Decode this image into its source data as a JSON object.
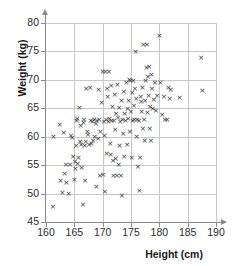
{
  "chart_data": {
    "type": "scatter",
    "title": "",
    "xlabel": "Height (cm)",
    "ylabel": "Weight (kg)",
    "xlim": [
      160,
      190
    ],
    "ylim": [
      45,
      80
    ],
    "xticks": [
      160,
      165,
      170,
      175,
      180,
      185,
      190
    ],
    "yticks": [
      45,
      50,
      55,
      60,
      65,
      70,
      75,
      80
    ],
    "grid": true,
    "legend": null,
    "marker": "x",
    "marker_color": "#333333",
    "grid_color": "#c8c8c8",
    "axis_color": "#8a8a8a",
    "points": [
      [
        161.2,
        47.7
      ],
      [
        161.3,
        60.1
      ],
      [
        162.4,
        62.2
      ],
      [
        162.6,
        52.3
      ],
      [
        162.9,
        50.2
      ],
      [
        163.1,
        60.7
      ],
      [
        163.3,
        53.6
      ],
      [
        163.5,
        55.1
      ],
      [
        163.6,
        52.0
      ],
      [
        164.0,
        50.0
      ],
      [
        164.2,
        55.2
      ],
      [
        164.4,
        60.3
      ],
      [
        164.6,
        59.9
      ],
      [
        164.8,
        56.5
      ],
      [
        165.0,
        52.4
      ],
      [
        165.1,
        55.6
      ],
      [
        165.2,
        54.4
      ],
      [
        165.3,
        58.5
      ],
      [
        165.4,
        62.8
      ],
      [
        165.5,
        63.2
      ],
      [
        165.6,
        55.3
      ],
      [
        165.7,
        56.4
      ],
      [
        165.9,
        65.1
      ],
      [
        166.0,
        59.1
      ],
      [
        166.1,
        61.9
      ],
      [
        166.2,
        58.7
      ],
      [
        166.3,
        54.6
      ],
      [
        166.5,
        48.0
      ],
      [
        166.6,
        62.5
      ],
      [
        166.7,
        63.1
      ],
      [
        166.8,
        58.4
      ],
      [
        166.9,
        52.3
      ],
      [
        167.0,
        59.2
      ],
      [
        167.1,
        68.4
      ],
      [
        167.3,
        61.0
      ],
      [
        167.4,
        60.4
      ],
      [
        167.6,
        58.6
      ],
      [
        167.8,
        68.6
      ],
      [
        167.9,
        62.9
      ],
      [
        168.0,
        58.8
      ],
      [
        168.2,
        62.6
      ],
      [
        168.3,
        59.4
      ],
      [
        168.5,
        63.0
      ],
      [
        168.6,
        60.1
      ],
      [
        168.8,
        62.4
      ],
      [
        168.9,
        51.3
      ],
      [
        169.0,
        62.8
      ],
      [
        169.2,
        59.6
      ],
      [
        169.3,
        68.3
      ],
      [
        169.4,
        63.0
      ],
      [
        169.5,
        53.2
      ],
      [
        169.6,
        61.0
      ],
      [
        169.8,
        66.0
      ],
      [
        170.0,
        71.4
      ],
      [
        170.1,
        53.3
      ],
      [
        170.2,
        62.7
      ],
      [
        170.3,
        60.3
      ],
      [
        170.4,
        50.4
      ],
      [
        170.5,
        71.5
      ],
      [
        170.6,
        63.0
      ],
      [
        170.7,
        57.1
      ],
      [
        170.8,
        68.4
      ],
      [
        170.9,
        67.0
      ],
      [
        171.0,
        62.7
      ],
      [
        171.1,
        71.4
      ],
      [
        171.2,
        63.2
      ],
      [
        171.3,
        58.8
      ],
      [
        171.4,
        56.8
      ],
      [
        171.5,
        69.0
      ],
      [
        171.6,
        62.9
      ],
      [
        171.7,
        65.4
      ],
      [
        171.8,
        55.8
      ],
      [
        171.9,
        53.2
      ],
      [
        172.0,
        62.9
      ],
      [
        172.1,
        67.4
      ],
      [
        172.2,
        61.3
      ],
      [
        172.3,
        56.2
      ],
      [
        172.4,
        64.1
      ],
      [
        172.5,
        53.2
      ],
      [
        172.6,
        69.2
      ],
      [
        172.7,
        63.3
      ],
      [
        172.8,
        55.1
      ],
      [
        172.9,
        65.2
      ],
      [
        173.0,
        58.5
      ],
      [
        173.1,
        62.6
      ],
      [
        173.2,
        53.1
      ],
      [
        173.3,
        66.3
      ],
      [
        173.4,
        49.6
      ],
      [
        173.5,
        63.1
      ],
      [
        173.6,
        60.5
      ],
      [
        173.7,
        68.0
      ],
      [
        173.8,
        56.5
      ],
      [
        173.9,
        64.0
      ],
      [
        174.0,
        62.8
      ],
      [
        174.2,
        69.5
      ],
      [
        174.3,
        58.6
      ],
      [
        174.4,
        65.0
      ],
      [
        174.5,
        63.2
      ],
      [
        174.6,
        66.4
      ],
      [
        174.7,
        70.0
      ],
      [
        174.8,
        61.0
      ],
      [
        174.9,
        69.8
      ],
      [
        175.0,
        64.5
      ],
      [
        175.1,
        56.4
      ],
      [
        175.2,
        67.8
      ],
      [
        175.3,
        62.8
      ],
      [
        175.4,
        69.9
      ],
      [
        175.5,
        65.5
      ],
      [
        175.6,
        63.0
      ],
      [
        175.7,
        68.5
      ],
      [
        175.8,
        74.9
      ],
      [
        175.9,
        66.8
      ],
      [
        176.0,
        60.0
      ],
      [
        176.1,
        63.0
      ],
      [
        176.2,
        54.8
      ],
      [
        176.4,
        62.9
      ],
      [
        176.5,
        50.5
      ],
      [
        176.6,
        56.4
      ],
      [
        176.7,
        67.0
      ],
      [
        176.8,
        66.2
      ],
      [
        176.9,
        64.5
      ],
      [
        177.0,
        68.6
      ],
      [
        177.1,
        61.4
      ],
      [
        177.2,
        76.2
      ],
      [
        177.3,
        63.0
      ],
      [
        177.4,
        59.4
      ],
      [
        177.5,
        66.3
      ],
      [
        177.6,
        69.9
      ],
      [
        177.7,
        72.1
      ],
      [
        177.8,
        76.2
      ],
      [
        177.9,
        64.2
      ],
      [
        178.0,
        70.6
      ],
      [
        178.1,
        67.2
      ],
      [
        178.2,
        72.3
      ],
      [
        178.3,
        61.5
      ],
      [
        178.4,
        65.4
      ],
      [
        178.5,
        59.3
      ],
      [
        178.6,
        71.0
      ],
      [
        178.7,
        68.5
      ],
      [
        178.8,
        65.0
      ],
      [
        179.0,
        66.5
      ],
      [
        179.2,
        69.5
      ],
      [
        179.4,
        64.6
      ],
      [
        179.6,
        67.3
      ],
      [
        180.0,
        77.8
      ],
      [
        180.2,
        69.6
      ],
      [
        180.5,
        63.9
      ],
      [
        180.8,
        67.0
      ],
      [
        181.0,
        63.0
      ],
      [
        181.4,
        63.0
      ],
      [
        181.6,
        68.6
      ],
      [
        181.8,
        66.8
      ],
      [
        182.0,
        68.3
      ],
      [
        183.6,
        66.9
      ],
      [
        187.4,
        74.0
      ],
      [
        187.6,
        68.2
      ]
    ]
  }
}
